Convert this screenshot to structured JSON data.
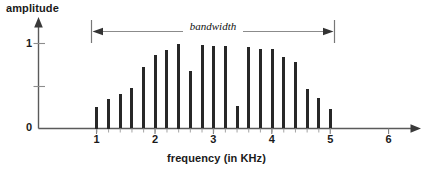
{
  "chart_data": {
    "type": "bar",
    "title": "",
    "xlabel": "frequency (in KHz)",
    "ylabel": "amplitude",
    "xlim": [
      0,
      6.4
    ],
    "ylim": [
      0,
      1.12
    ],
    "grid": false,
    "legend": "none",
    "x_tick_labels": [
      "1",
      "2",
      "3",
      "4",
      "5",
      "6"
    ],
    "x_tick_values": [
      1,
      2,
      3,
      4,
      5,
      6
    ],
    "y_tick_labels": [
      "0",
      "1"
    ],
    "y_tick_values": [
      0,
      1
    ],
    "y_minor_tick_values": [
      0.5
    ],
    "categories": [
      "1.0",
      "1.2",
      "1.4",
      "1.6",
      "1.8",
      "2.0",
      "2.2",
      "2.4",
      "2.6",
      "2.8",
      "3.0",
      "3.2",
      "3.4",
      "3.6",
      "3.8",
      "4.0",
      "4.2",
      "4.4",
      "4.6",
      "4.8",
      "5.0"
    ],
    "x": [
      1.0,
      1.2,
      1.4,
      1.6,
      1.8,
      2.0,
      2.2,
      2.4,
      2.6,
      2.8,
      3.0,
      3.2,
      3.4,
      3.6,
      3.8,
      4.0,
      4.2,
      4.4,
      4.6,
      4.8,
      5.0
    ],
    "values": [
      0.25,
      0.35,
      0.41,
      0.48,
      0.72,
      0.87,
      0.92,
      1.0,
      0.68,
      0.98,
      0.97,
      0.97,
      0.27,
      0.96,
      0.94,
      0.93,
      0.84,
      0.78,
      0.47,
      0.36,
      0.23
    ],
    "annotations": [
      {
        "name": "bandwidth",
        "label": "bandwidth",
        "style": "double-headed-arrow",
        "x_start": 1.0,
        "x_end": 5.0
      }
    ],
    "colors": {
      "bar": "#272727",
      "axis": "#5a5a5a",
      "annotation": "#6b6b6b",
      "text": "#1a1a1a",
      "background": "#ffffff"
    }
  }
}
